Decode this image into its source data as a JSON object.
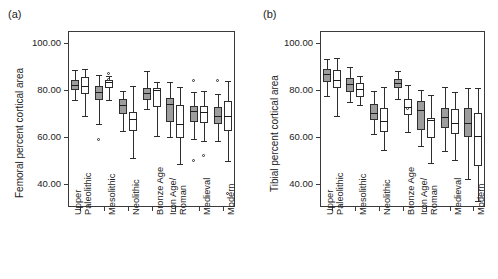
{
  "figure": {
    "panel_a_letter": "(a)",
    "panel_b_letter": "(b)"
  },
  "chart_data": [
    {
      "type": "box",
      "panel": "(a)",
      "title": "",
      "xlabel": "",
      "ylabel": "Femoral percent cortical area",
      "ylim": [
        30,
        105
      ],
      "yticks": [
        40,
        60,
        80,
        100
      ],
      "ytick_labels": [
        "40.00",
        "60.00",
        "80.00",
        "100.00"
      ],
      "grid": false,
      "legend": "none",
      "categories": [
        "Upper\nPaleolithic",
        "Mesolithic",
        "Neolithic",
        "Bronze Age",
        "Iron Age/\nRoman",
        "Medieval",
        "Modern"
      ],
      "series": [
        {
          "name": "shaded",
          "fill": "#9d9d9d",
          "boxes": [
            {
              "category": "Upper Paleolithic",
              "whisker_low": 75.8,
              "q1": 80.0,
              "median": 82.2,
              "q3": 84.0,
              "whisker_high": 88.4,
              "outliers": []
            },
            {
              "category": "Mesolithic",
              "whisker_low": 65.5,
              "q1": 75.6,
              "median": 79.2,
              "q3": 81.6,
              "whisker_high": 86.4,
              "outliers": [
                58.6
              ]
            },
            {
              "category": "Neolithic",
              "whisker_low": 62.3,
              "q1": 69.6,
              "median": 73.4,
              "q3": 76.0,
              "whisker_high": 79.5,
              "outliers": []
            },
            {
              "category": "Bronze Age",
              "whisker_low": 71.6,
              "q1": 75.5,
              "median": 78.7,
              "q3": 80.6,
              "whisker_high": 87.9,
              "outliers": []
            },
            {
              "category": "Iron Age/Roman",
              "whisker_low": 59.8,
              "q1": 66.3,
              "median": 73.7,
              "q3": 76.3,
              "whisker_high": 83.1,
              "outliers": []
            },
            {
              "category": "Medieval",
              "whisker_low": 58.9,
              "q1": 66.3,
              "median": 70.9,
              "q3": 73.2,
              "whisker_high": 79.1,
              "outliers": [
                83.7,
                49.6
              ]
            },
            {
              "category": "Modern",
              "whisker_low": 58.3,
              "q1": 65.3,
              "median": 68.9,
              "q3": 72.6,
              "whisker_high": 78.1,
              "outliers": [
                83.9
              ]
            }
          ]
        },
        {
          "name": "open",
          "fill": "#ffffff",
          "boxes": [
            {
              "category": "Upper Paleolithic",
              "whisker_low": 68.9,
              "q1": 78.0,
              "median": 81.6,
              "q3": 85.6,
              "whisker_high": 89.0,
              "outliers": []
            },
            {
              "category": "Mesolithic",
              "whisker_low": 75.4,
              "q1": 80.6,
              "median": 83.4,
              "q3": 84.3,
              "whisker_high": 86.0,
              "outliers": [
                86.8,
                84.0
              ]
            },
            {
              "category": "Neolithic",
              "whisker_low": 50.7,
              "q1": 62.2,
              "median": 67.6,
              "q3": 70.3,
              "whisker_high": 81.4,
              "outliers": []
            },
            {
              "category": "Bronze Age",
              "whisker_low": 60.1,
              "q1": 72.6,
              "median": 79.8,
              "q3": 80.5,
              "whisker_high": 83.4,
              "outliers": []
            },
            {
              "category": "Iron Age/Roman",
              "whisker_low": 48.5,
              "q1": 59.5,
              "median": 65.5,
              "q3": 73.6,
              "whisker_high": 81.2,
              "outliers": []
            },
            {
              "category": "Medieval",
              "whisker_low": 58.0,
              "q1": 65.6,
              "median": 70.6,
              "q3": 73.0,
              "whisker_high": 79.3,
              "outliers": [
                51.8
              ]
            },
            {
              "category": "Modern",
              "whisker_low": 49.4,
              "q1": 62.4,
              "median": 68.9,
              "q3": 75.0,
              "whisker_high": 83.8,
              "outliers": [
                35.7
              ]
            }
          ]
        }
      ]
    },
    {
      "type": "box",
      "panel": "(b)",
      "title": "",
      "xlabel": "",
      "ylabel": "Tibial percent cortical area",
      "ylim": [
        30,
        105
      ],
      "yticks": [
        40,
        60,
        80,
        100
      ],
      "ytick_labels": [
        "40.00",
        "60.00",
        "80.00",
        "100.00"
      ],
      "grid": false,
      "legend": "none",
      "categories": [
        "Upper\nPaleolithic",
        "Mesolithic",
        "Neolithic",
        "Bronze Age",
        "Iron Age/\nRoman",
        "Medieval",
        "Modern"
      ],
      "series": [
        {
          "name": "shaded",
          "fill": "#9d9d9d",
          "boxes": [
            {
              "category": "Upper Paleolithic",
              "whisker_low": 77.5,
              "q1": 83.1,
              "median": 86.6,
              "q3": 88.6,
              "whisker_high": 93.2,
              "outliers": []
            },
            {
              "category": "Mesolithic",
              "whisker_low": 74.7,
              "q1": 79.1,
              "median": 82.4,
              "q3": 84.9,
              "whisker_high": 89.6,
              "outliers": []
            },
            {
              "category": "Neolithic",
              "whisker_low": 61.0,
              "q1": 67.0,
              "median": 70.2,
              "q3": 74.0,
              "whisker_high": 79.5,
              "outliers": []
            },
            {
              "category": "Bronze Age",
              "whisker_low": 76.0,
              "q1": 80.7,
              "median": 83.0,
              "q3": 84.5,
              "whisker_high": 88.0,
              "outliers": []
            },
            {
              "category": "Iron Age/Roman",
              "whisker_low": 56.0,
              "q1": 63.0,
              "median": 71.2,
              "q3": 75.0,
              "whisker_high": 80.0,
              "outliers": []
            },
            {
              "category": "Medieval",
              "whisker_low": 54.0,
              "q1": 63.8,
              "median": 68.4,
              "q3": 72.4,
              "whisker_high": 81.1,
              "outliers": []
            },
            {
              "category": "Modern",
              "whisker_low": 42.0,
              "q1": 60.0,
              "median": 66.0,
              "q3": 72.0,
              "whisker_high": 80.5,
              "outliers": []
            }
          ]
        },
        {
          "name": "open",
          "fill": "#ffffff",
          "boxes": [
            {
              "category": "Upper Paleolithic",
              "whisker_low": 68.6,
              "q1": 80.6,
              "median": 84.3,
              "q3": 88.3,
              "whisker_high": 93.5,
              "outliers": []
            },
            {
              "category": "Mesolithic",
              "whisker_low": 73.3,
              "q1": 77.0,
              "median": 80.2,
              "q3": 82.8,
              "whisker_high": 85.9,
              "outliers": []
            },
            {
              "category": "Neolithic",
              "whisker_low": 54.3,
              "q1": 62.1,
              "median": 66.6,
              "q3": 72.0,
              "whisker_high": 81.0,
              "outliers": []
            },
            {
              "category": "Bronze Age",
              "whisker_low": 61.8,
              "q1": 69.4,
              "median": 72.6,
              "q3": 76.0,
              "whisker_high": 81.9,
              "outliers": [
                71.6
              ]
            },
            {
              "category": "Iron Age/Roman",
              "whisker_low": 48.8,
              "q1": 59.5,
              "median": 66.9,
              "q3": 67.9,
              "whisker_high": 77.8,
              "outliers": []
            },
            {
              "category": "Medieval",
              "whisker_low": 50.0,
              "q1": 60.9,
              "median": 65.7,
              "q3": 71.6,
              "whisker_high": 79.2,
              "outliers": []
            },
            {
              "category": "Modern",
              "whisker_low": 32.5,
              "q1": 47.5,
              "median": 60.4,
              "q3": 70.0,
              "whisker_high": 80.5,
              "outliers": []
            }
          ]
        }
      ]
    }
  ]
}
